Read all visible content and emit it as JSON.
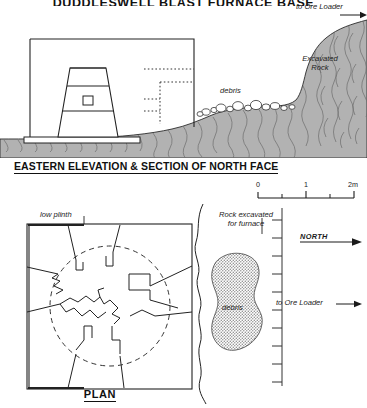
{
  "drawing": {
    "title": "DUDDLESWELL BLAST FURNACE BASE",
    "section_title": "EASTERN ELEVATION & SECTION OF NORTH FACE",
    "plan_caption": "PLAN"
  },
  "elevation": {
    "labels": {
      "ore_loader": "to Ore Loader",
      "excavated_rock_line1": "Excavated",
      "excavated_rock_line2": "Rock",
      "debris": "debris"
    }
  },
  "plan": {
    "labels": {
      "low_plinth": "low plinth",
      "rock_excavated_line1": "Rock excavated",
      "rock_excavated_line2": "for furnace",
      "debris": "debris",
      "north": "NORTH",
      "ore_loader": "to Ore Loader"
    }
  },
  "scale_bar": {
    "ticks": [
      "0",
      "1",
      "2m"
    ],
    "minor_ticks": 4,
    "unit": "m",
    "span_meters": 2
  },
  "colors": {
    "ink": "#111111",
    "rock_fill": "#b3b3b3",
    "rock_texture": "#6f6f6f",
    "debris_stipple": "#8a8a8a",
    "paper": "#ffffff"
  },
  "icons": {
    "north_arrow": "arrow-right",
    "ore_loader_arrow": "arrow-right"
  }
}
